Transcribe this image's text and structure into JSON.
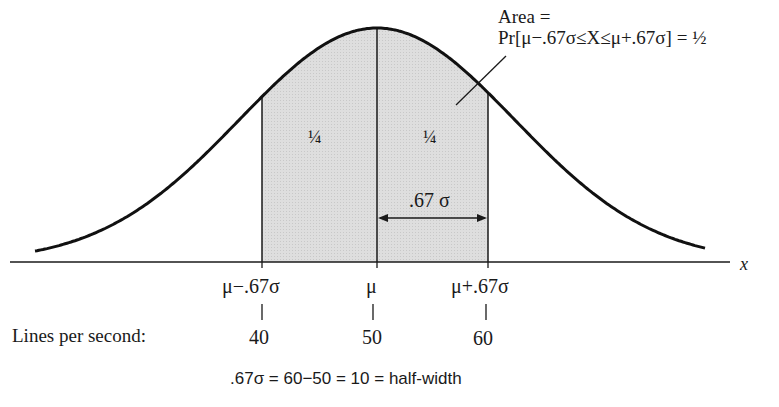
{
  "figure": {
    "annotation": {
      "line1": "Area =",
      "line2": "Pr[μ−.67σ≤X≤μ+.67σ] = ½"
    },
    "regions": [
      {
        "label": "¼",
        "side": "left"
      },
      {
        "label": "¼",
        "side": "right"
      }
    ],
    "width_marker": ".67 σ",
    "axis_label": "x",
    "ticks": [
      {
        "symbol": "μ−.67σ",
        "value": "40"
      },
      {
        "symbol": "μ",
        "value": "50"
      },
      {
        "symbol": "μ+.67σ",
        "value": "60"
      }
    ],
    "scale_label": "Lines per second:",
    "equation": ".67σ = 60−50 = 10 = half-width",
    "colors": {
      "shade": "#d9d9d9",
      "line": "#1a1a1a",
      "background": "#ffffff"
    }
  },
  "chart_data": {
    "type": "area",
    "xlabel": "x",
    "distribution": "normal",
    "mean": 50,
    "half_width": 10,
    "sigma_multiple": 0.67,
    "shaded_interval": [
      40,
      60
    ],
    "shaded_probability": 0.5,
    "sub_areas": [
      {
        "interval": [
          40,
          50
        ],
        "area": 0.25
      },
      {
        "interval": [
          50,
          60
        ],
        "area": 0.25
      }
    ],
    "tick_labels": [
      "μ−.67σ",
      "μ",
      "μ+.67σ"
    ],
    "tick_values": [
      40,
      50,
      60
    ],
    "grid": false
  }
}
